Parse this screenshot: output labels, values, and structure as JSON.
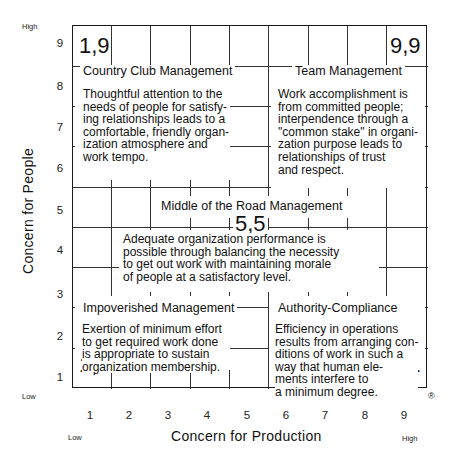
{
  "diagram": {
    "type": "managerial-grid",
    "axes": {
      "x": {
        "label": "Concern for Production",
        "low": "Low",
        "high": "High",
        "ticks": [
          "1",
          "2",
          "3",
          "4",
          "5",
          "6",
          "7",
          "8",
          "9"
        ]
      },
      "y": {
        "label": "Concern for People",
        "low": "Low",
        "high": "High",
        "ticks": [
          "9",
          "8",
          "7",
          "6",
          "5",
          "4",
          "3",
          "2",
          "1"
        ]
      }
    },
    "styles": [
      {
        "coords": "1,9",
        "title": "Country Club Management",
        "description": [
          "Thoughtful attention to the",
          "needs of people for satisfy-",
          "ing relationships leads to a",
          "comfortable, friendly organ-",
          "ization atmosphere and",
          "work tempo."
        ]
      },
      {
        "coords": "9,9",
        "title": "Team Management",
        "description": [
          "Work accomplishment is",
          "from committed people;",
          "interpendence through a",
          "\"common stake\" in organi-",
          "zation purpose leads to",
          "relationships of trust",
          "and respect."
        ]
      },
      {
        "coords": "5,5",
        "title": "Middle of the Road Management",
        "description": [
          "Adequate organization performance is",
          "possible through balancing the necessity",
          "to get out work with maintaining morale",
          "of people at a satisfactory level."
        ]
      },
      {
        "coords": "1,1",
        "title": "Impoverished Management",
        "description": [
          "Exertion of minimum effort",
          "to get required work done",
          "is appropriate to sustain",
          "organization membership."
        ]
      },
      {
        "coords": "9,1",
        "title": "Authority-Compliance",
        "description": [
          "Efficiency in operations",
          "results from arranging con-",
          "ditions of work in such a",
          "way that human ele-",
          "ments interfere to",
          "a minimum degree."
        ]
      }
    ],
    "registered_mark": "®"
  },
  "colors": {
    "ink": "#1a1a1a",
    "background": "#ffffff"
  }
}
